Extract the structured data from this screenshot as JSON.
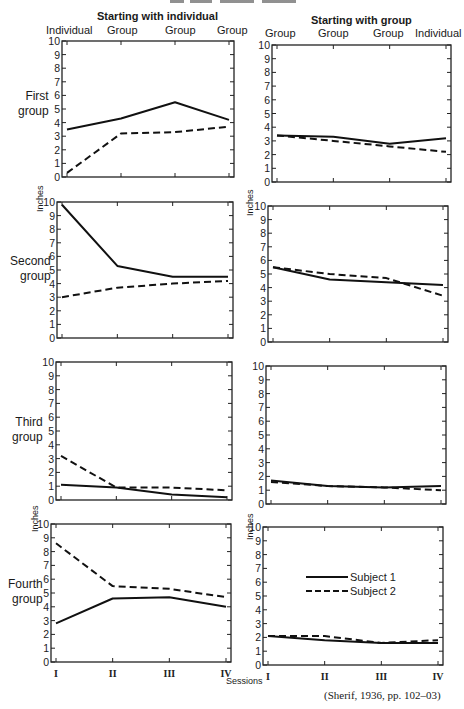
{
  "header": {
    "left_title": "Starting with individual",
    "right_title": "Starting with group",
    "left_sessions": [
      "Individual",
      "Group",
      "Group",
      "Group"
    ],
    "right_sessions": [
      "Group",
      "Group",
      "Group",
      "Individual"
    ]
  },
  "rows": [
    {
      "label_line1": "First",
      "label_line2": "group"
    },
    {
      "label_line1": "Second",
      "label_line2": "group"
    },
    {
      "label_line1": "Third",
      "label_line2": "group"
    },
    {
      "label_line1": "Fourth",
      "label_line2": "group"
    }
  ],
  "axis": {
    "y_label": "Inches",
    "y_ticks": [
      "0",
      "1",
      "2",
      "3",
      "4",
      "5",
      "6",
      "7",
      "8",
      "9",
      "10"
    ],
    "x_ticks": [
      "I",
      "II",
      "III",
      "IV"
    ],
    "x_label": "Sessions"
  },
  "legend": {
    "subject1": "Subject 1",
    "subject2": "Subject 2"
  },
  "citation": "(Sherif, 1936, pp. 102–03)",
  "chart_data": [
    {
      "type": "line",
      "title": "First group — Starting with individual",
      "categories": [
        "I",
        "II",
        "III",
        "IV"
      ],
      "session_types": [
        "Individual",
        "Group",
        "Group",
        "Group"
      ],
      "ylabel": "Inches",
      "ylim": [
        0,
        10
      ],
      "series": [
        {
          "name": "Subject 1",
          "style": "solid",
          "values": [
            3.5,
            4.3,
            5.5,
            4.2
          ]
        },
        {
          "name": "Subject 2",
          "style": "dashed",
          "values": [
            0.3,
            3.2,
            3.3,
            3.7
          ]
        }
      ]
    },
    {
      "type": "line",
      "title": "First group — Starting with group",
      "categories": [
        "I",
        "II",
        "III",
        "IV"
      ],
      "session_types": [
        "Group",
        "Group",
        "Group",
        "Individual"
      ],
      "ylabel": "Inches",
      "ylim": [
        0,
        10
      ],
      "series": [
        {
          "name": "Subject 1",
          "style": "solid",
          "values": [
            3.4,
            3.3,
            2.8,
            3.2
          ]
        },
        {
          "name": "Subject 2",
          "style": "dashed",
          "values": [
            3.4,
            3.0,
            2.6,
            2.2
          ]
        }
      ]
    },
    {
      "type": "line",
      "title": "Second group — Starting with individual",
      "categories": [
        "I",
        "II",
        "III",
        "IV"
      ],
      "session_types": [
        "Individual",
        "Group",
        "Group",
        "Group"
      ],
      "ylabel": "Inches",
      "ylim": [
        0,
        10
      ],
      "series": [
        {
          "name": "Subject 1",
          "style": "solid",
          "values": [
            9.8,
            5.3,
            4.5,
            4.5
          ]
        },
        {
          "name": "Subject 2",
          "style": "dashed",
          "values": [
            3.0,
            3.7,
            4.0,
            4.2
          ]
        }
      ]
    },
    {
      "type": "line",
      "title": "Second group — Starting with group",
      "categories": [
        "I",
        "II",
        "III",
        "IV"
      ],
      "session_types": [
        "Group",
        "Group",
        "Group",
        "Individual"
      ],
      "ylabel": "Inches",
      "ylim": [
        0,
        10
      ],
      "series": [
        {
          "name": "Subject 1",
          "style": "solid",
          "values": [
            5.5,
            4.6,
            4.4,
            4.2
          ]
        },
        {
          "name": "Subject 2",
          "style": "dashed",
          "values": [
            5.5,
            5.0,
            4.7,
            3.4
          ]
        }
      ]
    },
    {
      "type": "line",
      "title": "Third group — Starting with individual",
      "categories": [
        "I",
        "II",
        "III",
        "IV"
      ],
      "session_types": [
        "Individual",
        "Group",
        "Group",
        "Group"
      ],
      "ylabel": "Inches",
      "ylim": [
        0,
        10
      ],
      "series": [
        {
          "name": "Subject 1",
          "style": "solid",
          "values": [
            1.1,
            0.9,
            0.4,
            0.2
          ]
        },
        {
          "name": "Subject 2",
          "style": "dashed",
          "values": [
            3.2,
            0.9,
            0.9,
            0.7
          ]
        }
      ]
    },
    {
      "type": "line",
      "title": "Third group — Starting with group",
      "categories": [
        "I",
        "II",
        "III",
        "IV"
      ],
      "session_types": [
        "Group",
        "Group",
        "Group",
        "Individual"
      ],
      "ylabel": "Inches",
      "ylim": [
        0,
        10
      ],
      "series": [
        {
          "name": "Subject 1",
          "style": "solid",
          "values": [
            1.7,
            1.3,
            1.2,
            1.3
          ]
        },
        {
          "name": "Subject 2",
          "style": "dashed",
          "values": [
            1.6,
            1.3,
            1.2,
            1.0
          ]
        }
      ]
    },
    {
      "type": "line",
      "title": "Fourth group — Starting with individual",
      "categories": [
        "I",
        "II",
        "III",
        "IV"
      ],
      "session_types": [
        "Individual",
        "Group",
        "Group",
        "Group"
      ],
      "xlabel": "Sessions",
      "ylabel": "Inches",
      "ylim": [
        0,
        10
      ],
      "series": [
        {
          "name": "Subject 1",
          "style": "solid",
          "values": [
            2.8,
            4.6,
            4.7,
            4.0
          ]
        },
        {
          "name": "Subject 2",
          "style": "dashed",
          "values": [
            8.6,
            5.5,
            5.3,
            4.7
          ]
        }
      ]
    },
    {
      "type": "line",
      "title": "Fourth group — Starting with group",
      "categories": [
        "I",
        "II",
        "III",
        "IV"
      ],
      "session_types": [
        "Group",
        "Group",
        "Group",
        "Individual"
      ],
      "xlabel": "Sessions",
      "ylabel": "Inches",
      "ylim": [
        0,
        10
      ],
      "series": [
        {
          "name": "Subject 1",
          "style": "solid",
          "values": [
            2.1,
            1.8,
            1.6,
            1.6
          ]
        },
        {
          "name": "Subject 2",
          "style": "dashed",
          "values": [
            2.1,
            2.1,
            1.6,
            1.8
          ]
        }
      ]
    }
  ]
}
